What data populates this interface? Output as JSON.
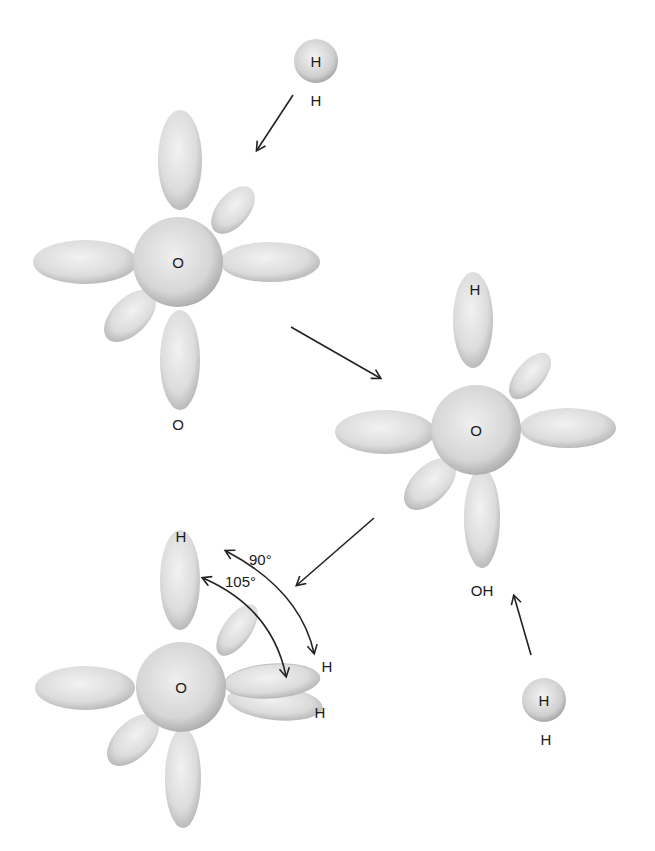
{
  "diagram": {
    "stages": [
      {
        "id": "stage1",
        "center_label": "O",
        "bottom_label": "O"
      },
      {
        "id": "stage2",
        "center_label": "O",
        "top_label": "H",
        "bottom_label": "OH"
      },
      {
        "id": "stage3",
        "center_label": "O",
        "top_label": "H",
        "right_labels": [
          "H",
          "H"
        ]
      }
    ],
    "hydrogen_atoms": [
      {
        "id": "h-top",
        "inner_label": "H",
        "below_label": "H"
      },
      {
        "id": "h-bottom",
        "inner_label": "H",
        "below_label": "H"
      }
    ],
    "angles": {
      "a90": "90°",
      "a105": "105°"
    }
  }
}
